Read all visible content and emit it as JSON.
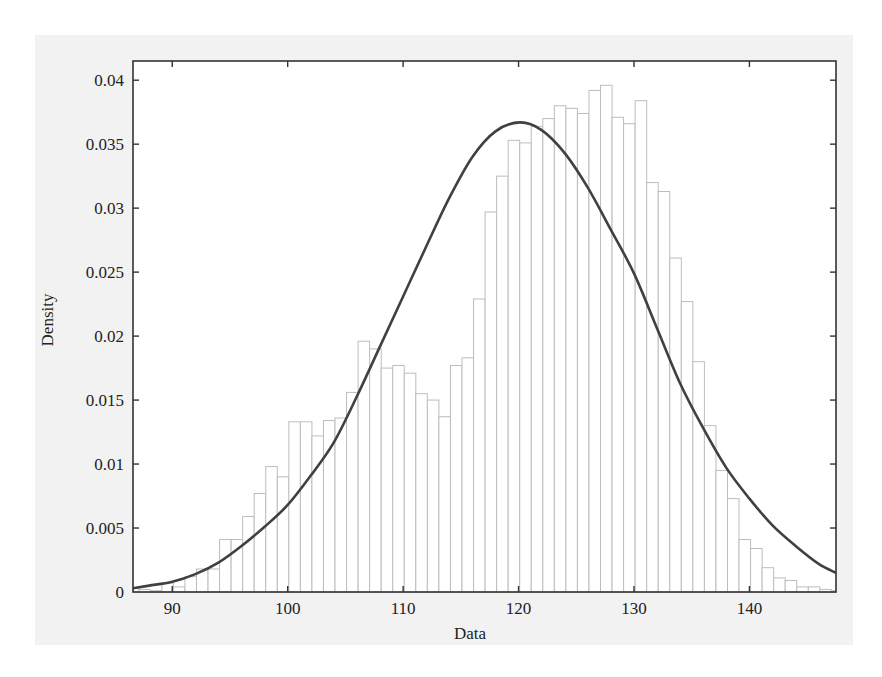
{
  "chart_data": {
    "type": "bar",
    "subtype": "histogram_with_density_curve",
    "title": "",
    "xlabel": "Data",
    "ylabel": "Density",
    "xlim": [
      86.6,
      147.5
    ],
    "ylim": [
      0,
      0.0415
    ],
    "x_ticks": [
      90,
      100,
      110,
      120,
      130,
      140
    ],
    "x_tick_labels": [
      "90",
      "100",
      "110",
      "120",
      "130",
      "140"
    ],
    "y_ticks": [
      0,
      0.005,
      0.01,
      0.015,
      0.02,
      0.025,
      0.03,
      0.035,
      0.04
    ],
    "y_tick_labels": [
      "0",
      "0.005",
      "0.01",
      "0.015",
      "0.02",
      "0.025",
      "0.03",
      "0.035",
      "0.04"
    ],
    "grid": false,
    "legend": null,
    "bin_width": 1,
    "histogram": {
      "name": "Density histogram",
      "bin_left_edges": [
        86.6,
        87.1,
        88.1,
        89.1,
        90.1,
        91.1,
        92.1,
        93.1,
        94.1,
        95.1,
        96.1,
        97.1,
        98.1,
        99.1,
        100.1,
        101.1,
        102.1,
        103.1,
        104.1,
        105.1,
        106.1,
        107.1,
        108.1,
        109.1,
        110.1,
        111.1,
        112.1,
        113.1,
        114.1,
        115.1,
        116.1,
        117.1,
        118.1,
        119.1,
        120.1,
        121.1,
        122.1,
        123.1,
        124.1,
        125.1,
        126.1,
        127.1,
        128.1,
        129.1,
        130.1,
        131.1,
        132.1,
        133.1,
        134.1,
        135.1,
        136.1,
        137.1,
        138.1,
        139.1,
        140.1,
        141.1,
        142.1,
        143.1,
        144.1,
        145.1,
        146.1,
        147.1
      ],
      "bin_right_edges": [
        87.1,
        88.1,
        89.1,
        90.1,
        91.1,
        92.1,
        93.1,
        94.1,
        95.1,
        96.1,
        97.1,
        98.1,
        99.1,
        100.1,
        101.1,
        102.1,
        103.1,
        104.1,
        105.1,
        106.1,
        107.1,
        108.1,
        109.1,
        110.1,
        111.1,
        112.1,
        113.1,
        114.1,
        115.1,
        116.1,
        117.1,
        118.1,
        119.1,
        120.1,
        121.1,
        122.1,
        123.1,
        124.1,
        125.1,
        126.1,
        127.1,
        128.1,
        129.1,
        130.1,
        131.1,
        132.1,
        133.1,
        134.1,
        135.1,
        136.1,
        137.1,
        138.1,
        139.1,
        140.1,
        141.1,
        142.1,
        143.1,
        144.1,
        145.1,
        146.1,
        147.1,
        147.5
      ],
      "values": [
        0.0003,
        0.0002,
        0.0001,
        0.0007,
        0.0004,
        0.0012,
        0.0018,
        0.0018,
        0.0041,
        0.0041,
        0.0059,
        0.0077,
        0.0098,
        0.009,
        0.0133,
        0.0133,
        0.0122,
        0.0134,
        0.0136,
        0.0156,
        0.0196,
        0.019,
        0.0175,
        0.0177,
        0.0171,
        0.0155,
        0.015,
        0.0137,
        0.0177,
        0.0183,
        0.0229,
        0.0297,
        0.0325,
        0.0353,
        0.0351,
        0.0364,
        0.037,
        0.038,
        0.0378,
        0.0374,
        0.0392,
        0.0396,
        0.0371,
        0.0366,
        0.0384,
        0.032,
        0.0313,
        0.0261,
        0.0227,
        0.018,
        0.013,
        0.0095,
        0.0073,
        0.0041,
        0.0034,
        0.0019,
        0.0011,
        0.0009,
        0.0004,
        0.0004,
        0.0002,
        0.0001
      ]
    },
    "series": [
      {
        "name": "Fitted normal density",
        "type": "line",
        "x": [
          86.6,
          88,
          90,
          92,
          94,
          96,
          98,
          100,
          102,
          104,
          106,
          108,
          110,
          112,
          114,
          116,
          118,
          120.1,
          122,
          124,
          126,
          128,
          130,
          132,
          134,
          136,
          138,
          140,
          142,
          144,
          146,
          147.5
        ],
        "values": [
          0.0003,
          0.0005,
          0.0008,
          0.0014,
          0.0023,
          0.0036,
          0.0051,
          0.0068,
          0.0091,
          0.0117,
          0.0153,
          0.0192,
          0.0231,
          0.027,
          0.0308,
          0.034,
          0.036,
          0.0367,
          0.0361,
          0.0343,
          0.0316,
          0.0283,
          0.0249,
          0.0206,
          0.0163,
          0.0128,
          0.0097,
          0.0073,
          0.0052,
          0.0036,
          0.0022,
          0.0015
        ]
      }
    ],
    "colors": {
      "bar_edge": "#bdbdbd",
      "bar_fill": "#ffffff",
      "curve": "#404040",
      "axes": "#333333",
      "panel_background": "#f2f2f2"
    }
  }
}
